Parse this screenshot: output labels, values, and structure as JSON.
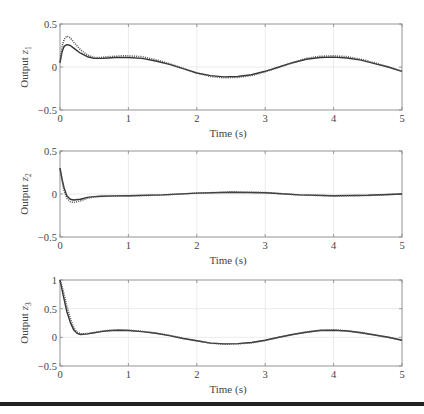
{
  "figure": {
    "background": "#ffffff",
    "line_color": "#333333",
    "dotted_color": "#555555",
    "grid_color": "#e6e6e6",
    "axis_color": "#888888"
  },
  "chart_data": [
    {
      "type": "line",
      "title": "",
      "xlabel": "Time (s)",
      "ylabel": "Output z",
      "ylabel_subscript": "1",
      "xlim": [
        0,
        5
      ],
      "ylim": [
        -0.5,
        0.5
      ],
      "xticks": [
        0,
        1,
        2,
        3,
        4,
        5
      ],
      "yticks": [
        -0.5,
        0,
        0.5
      ],
      "xtick_labels": [
        "0",
        "1",
        "2",
        "3",
        "4",
        "5"
      ],
      "ytick_labels": [
        "−0.5",
        "0",
        "0.5"
      ],
      "grid": true,
      "series": [
        {
          "name": "actual",
          "style": "solid",
          "x": [
            0,
            0.03,
            0.06,
            0.1,
            0.15,
            0.2,
            0.3,
            0.4,
            0.5,
            0.6,
            0.7,
            0.8,
            0.9,
            1.0,
            1.2,
            1.4,
            1.6,
            1.8,
            2.0,
            2.2,
            2.4,
            2.6,
            2.8,
            3.0,
            3.2,
            3.4,
            3.6,
            3.8,
            4.0,
            4.2,
            4.4,
            4.6,
            4.8,
            5.0
          ],
          "values": [
            0.05,
            0.18,
            0.24,
            0.26,
            0.25,
            0.22,
            0.16,
            0.12,
            0.1,
            0.1,
            0.105,
            0.11,
            0.11,
            0.11,
            0.1,
            0.07,
            0.03,
            -0.02,
            -0.07,
            -0.1,
            -0.115,
            -0.11,
            -0.09,
            -0.05,
            0.0,
            0.05,
            0.09,
            0.11,
            0.115,
            0.105,
            0.08,
            0.04,
            0.0,
            -0.05
          ]
        },
        {
          "name": "reference",
          "style": "dotted",
          "x": [
            0,
            0.03,
            0.06,
            0.1,
            0.15,
            0.2,
            0.3,
            0.4,
            0.5,
            0.6,
            0.7,
            0.8,
            0.9,
            1.0,
            1.2,
            1.4,
            1.6,
            1.8,
            2.0,
            2.2,
            2.4,
            2.6,
            2.8,
            3.0,
            3.2,
            3.4,
            3.6,
            3.8,
            4.0,
            4.2,
            4.4,
            4.6,
            4.8,
            5.0
          ],
          "values": [
            0.05,
            0.24,
            0.32,
            0.36,
            0.34,
            0.29,
            0.2,
            0.14,
            0.11,
            0.11,
            0.12,
            0.125,
            0.13,
            0.13,
            0.12,
            0.085,
            0.04,
            -0.015,
            -0.07,
            -0.11,
            -0.125,
            -0.12,
            -0.1,
            -0.055,
            -0.005,
            0.05,
            0.1,
            0.125,
            0.13,
            0.12,
            0.09,
            0.05,
            0.0,
            -0.05
          ]
        }
      ]
    },
    {
      "type": "line",
      "title": "",
      "xlabel": "Time (s)",
      "ylabel": "Output z",
      "ylabel_subscript": "2",
      "xlim": [
        0,
        5
      ],
      "ylim": [
        -0.5,
        0.5
      ],
      "xticks": [
        0,
        1,
        2,
        3,
        4,
        5
      ],
      "yticks": [
        -0.5,
        0,
        0.5
      ],
      "xtick_labels": [
        "0",
        "1",
        "2",
        "3",
        "4",
        "5"
      ],
      "ytick_labels": [
        "−0.5",
        "0",
        "0.5"
      ],
      "grid": true,
      "series": [
        {
          "name": "actual",
          "style": "solid",
          "x": [
            0,
            0.03,
            0.06,
            0.1,
            0.15,
            0.2,
            0.3,
            0.4,
            0.5,
            0.6,
            0.8,
            1.0,
            1.5,
            2.0,
            2.5,
            3.0,
            3.5,
            4.0,
            4.5,
            5.0
          ],
          "values": [
            0.3,
            0.17,
            0.07,
            -0.02,
            -0.06,
            -0.07,
            -0.06,
            -0.04,
            -0.03,
            -0.025,
            -0.022,
            -0.02,
            -0.01,
            0.01,
            0.02,
            0.015,
            -0.01,
            -0.02,
            -0.015,
            0.0
          ]
        },
        {
          "name": "reference",
          "style": "dotted",
          "x": [
            0,
            0.03,
            0.06,
            0.1,
            0.15,
            0.2,
            0.3,
            0.4,
            0.5,
            0.6,
            0.8,
            1.0,
            1.5,
            2.0,
            2.5,
            3.0,
            3.5,
            4.0,
            4.5,
            5.0
          ],
          "values": [
            0.3,
            0.15,
            0.04,
            -0.05,
            -0.09,
            -0.1,
            -0.08,
            -0.05,
            -0.035,
            -0.028,
            -0.024,
            -0.022,
            -0.012,
            0.01,
            0.022,
            0.017,
            -0.01,
            -0.022,
            -0.017,
            0.0
          ]
        }
      ]
    },
    {
      "type": "line",
      "title": "",
      "xlabel": "Time (s)",
      "ylabel": "Output z",
      "ylabel_subscript": "3",
      "xlim": [
        0,
        5
      ],
      "ylim": [
        -0.5,
        1
      ],
      "xticks": [
        0,
        1,
        2,
        3,
        4,
        5
      ],
      "yticks": [
        -0.5,
        0,
        0.5,
        1
      ],
      "xtick_labels": [
        "0",
        "1",
        "2",
        "3",
        "4",
        "5"
      ],
      "ytick_labels": [
        "−0.5",
        "0",
        "0.5",
        "1"
      ],
      "grid": true,
      "series": [
        {
          "name": "actual",
          "style": "solid",
          "x": [
            0,
            0.05,
            0.1,
            0.15,
            0.2,
            0.25,
            0.3,
            0.4,
            0.5,
            0.6,
            0.7,
            0.85,
            1.0,
            1.2,
            1.4,
            1.6,
            1.8,
            2.0,
            2.2,
            2.4,
            2.6,
            2.8,
            3.0,
            3.2,
            3.4,
            3.6,
            3.8,
            4.0,
            4.2,
            4.4,
            4.6,
            4.8,
            5.0
          ],
          "values": [
            1.0,
            0.72,
            0.45,
            0.26,
            0.13,
            0.07,
            0.05,
            0.06,
            0.08,
            0.1,
            0.115,
            0.125,
            0.12,
            0.1,
            0.07,
            0.03,
            -0.02,
            -0.06,
            -0.1,
            -0.115,
            -0.11,
            -0.09,
            -0.05,
            0.0,
            0.05,
            0.09,
            0.12,
            0.125,
            0.11,
            0.08,
            0.04,
            0.0,
            -0.05
          ]
        },
        {
          "name": "reference",
          "style": "dotted",
          "x": [
            0,
            0.05,
            0.1,
            0.15,
            0.2,
            0.25,
            0.3,
            0.4,
            0.5,
            0.6,
            0.7,
            0.85,
            1.0,
            1.2,
            1.4,
            1.6,
            1.8,
            2.0,
            2.2,
            2.4,
            2.6,
            2.8,
            3.0,
            3.2,
            3.4,
            3.6,
            3.8,
            4.0,
            4.2,
            4.4,
            4.6,
            4.8,
            5.0
          ],
          "values": [
            1.0,
            0.8,
            0.55,
            0.33,
            0.17,
            0.09,
            0.06,
            0.065,
            0.085,
            0.105,
            0.12,
            0.13,
            0.125,
            0.105,
            0.075,
            0.035,
            -0.015,
            -0.06,
            -0.1,
            -0.12,
            -0.115,
            -0.095,
            -0.055,
            0.0,
            0.05,
            0.095,
            0.125,
            0.13,
            0.115,
            0.085,
            0.045,
            0.0,
            -0.05
          ]
        }
      ]
    }
  ],
  "layout": {
    "panels": [
      {
        "left": 60,
        "top": 24,
        "right": 402,
        "bottom": 110
      },
      {
        "left": 60,
        "top": 151,
        "right": 402,
        "bottom": 237
      },
      {
        "left": 60,
        "top": 280,
        "right": 402,
        "bottom": 366
      }
    ]
  }
}
